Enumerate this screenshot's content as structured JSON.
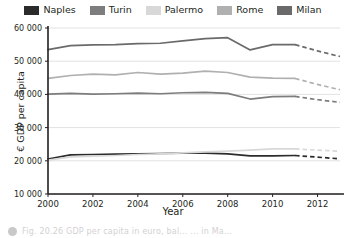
{
  "chart_data": {
    "type": "line",
    "title": "",
    "xlabel": "Year",
    "ylabel": "€ GDP per capita",
    "xlim": [
      2000,
      2013
    ],
    "ylim": [
      10000,
      60000
    ],
    "grid": true,
    "legend_position": "top",
    "x_ticks": [
      2000,
      2002,
      2004,
      2006,
      2008,
      2010,
      2012
    ],
    "x_tick_labels": [
      "2000",
      "2002",
      "2004",
      "2006",
      "2008",
      "2010",
      "2012"
    ],
    "y_ticks": [
      10000,
      20000,
      30000,
      40000,
      50000,
      60000
    ],
    "y_tick_labels": [
      "10 000",
      "20 000",
      "30 000",
      "40 000",
      "50 000",
      "60 000"
    ],
    "x": [
      2000,
      2001,
      2002,
      2003,
      2004,
      2005,
      2006,
      2007,
      2008,
      2009,
      2010,
      2011
    ],
    "x_forecast": [
      2011,
      2012,
      2013
    ],
    "series": [
      {
        "name": "Naples",
        "color": "#2b2b2b",
        "values": [
          20500,
          21800,
          21900,
          22000,
          22100,
          22200,
          22300,
          22300,
          22100,
          21500,
          21500,
          21600
        ],
        "forecast": [
          21600,
          21100,
          20600
        ]
      },
      {
        "name": "Turin",
        "color": "#7d7d7d",
        "values": [
          40100,
          40300,
          40100,
          40200,
          40400,
          40200,
          40500,
          40600,
          40300,
          38600,
          39300,
          39400
        ],
        "forecast": [
          39400,
          38400,
          37600
        ]
      },
      {
        "name": "Palermo",
        "color": "#d8d8d8",
        "values": [
          20200,
          21200,
          21400,
          21600,
          21900,
          22100,
          22400,
          22700,
          22900,
          23200,
          23600,
          23600
        ],
        "forecast": [
          23600,
          23200,
          22900
        ]
      },
      {
        "name": "Rome",
        "color": "#b0b0b0",
        "values": [
          44800,
          45700,
          46100,
          45900,
          46600,
          46100,
          46400,
          47000,
          46600,
          45200,
          44900,
          44800
        ],
        "forecast": [
          44800,
          43000,
          41400
        ]
      },
      {
        "name": "Milan",
        "color": "#6a6a6a",
        "values": [
          53500,
          54700,
          54900,
          55000,
          55300,
          55400,
          56100,
          56800,
          57100,
          53400,
          55000,
          55000
        ],
        "forecast": [
          55000,
          53100,
          51400
        ]
      }
    ]
  },
  "legend": {
    "items": [
      {
        "label": "Naples",
        "color": "#2b2b2b"
      },
      {
        "label": "Turin",
        "color": "#7d7d7d"
      },
      {
        "label": "Palermo",
        "color": "#d8d8d8"
      },
      {
        "label": "Rome",
        "color": "#b0b0b0"
      },
      {
        "label": "Milan",
        "color": "#6a6a6a"
      }
    ]
  },
  "axes": {
    "x_title": "Year",
    "y_title": "€ GDP per capita"
  },
  "caption": {
    "bullet": "bullet-icon",
    "text": "Fig. 20.26 GDP per capita in euro, bal... ... in Ma..."
  },
  "colors": {
    "axis": "#231f20",
    "grid": "#e2e2e2",
    "background": "#ffffff"
  }
}
